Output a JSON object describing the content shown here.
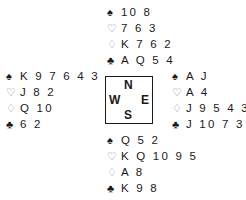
{
  "suits": {
    "spade": "♠",
    "heart": "♡",
    "diamond": "♢",
    "club": "♣"
  },
  "hands": {
    "north": {
      "spades": "10 8",
      "hearts": "7 6 3",
      "diamonds": "K 7 6 2",
      "clubs": "A Q 5 4"
    },
    "west": {
      "spades": "K 9 7 6 4 3",
      "hearts": "J 8 2",
      "diamonds": "Q 10",
      "clubs": "6 2"
    },
    "east": {
      "spades": "A J",
      "hearts": "A 4",
      "diamonds": "J 9 5 4 3",
      "clubs": "J 10 7 3"
    },
    "south": {
      "spades": "Q 5 2",
      "hearts": "K Q 10 9 5",
      "diamonds": "A 8",
      "clubs": "K 9 8"
    }
  },
  "compass": {
    "n": "N",
    "s": "S",
    "w": "W",
    "e": "E"
  },
  "colors": {
    "black_suit": "#1a1a1a",
    "red_suit": "#8a8a8a"
  }
}
